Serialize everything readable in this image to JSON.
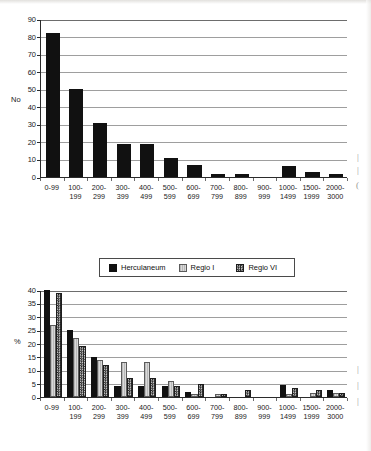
{
  "page": {
    "background": "#ffffff",
    "margin_marks": [
      "|",
      "|",
      "(",
      "|",
      "|",
      "|"
    ]
  },
  "colors": {
    "herculaneum": "#111111",
    "regio_i": "#d0d0d0",
    "regio_vi": "#3a3a3a",
    "axis": "#2b2b2b",
    "grid": "#9e9e9e"
  },
  "legend": {
    "position": "top-center",
    "entries": [
      {
        "label": "Herculaneum",
        "swatch": "solid-black"
      },
      {
        "label": "Regio I",
        "swatch": "light-gray"
      },
      {
        "label": "Regio VI",
        "swatch": "checkered"
      }
    ]
  },
  "chart_data": [
    {
      "id": "chart-top-counts",
      "type": "bar",
      "title": "",
      "xlabel": "",
      "ylabel": "No",
      "ylim": [
        0,
        90
      ],
      "yticks": [
        0,
        10,
        20,
        30,
        40,
        50,
        60,
        70,
        80,
        90
      ],
      "grid": true,
      "legend": false,
      "categories": [
        "0-99",
        "100-\n199",
        "200-\n299",
        "300-\n399",
        "400-\n499",
        "500-\n599",
        "600-\n699",
        "700-\n799",
        "800-\n899",
        "900-\n999",
        "1000-\n1499",
        "1500-\n1999",
        "2000-\n3000"
      ],
      "series": [
        {
          "name": "Herculaneum",
          "fill": "solid-black",
          "values": [
            82,
            50,
            31,
            19,
            19,
            11,
            7,
            2,
            2,
            0,
            6,
            3,
            2
          ]
        }
      ]
    },
    {
      "id": "chart-bottom-percent",
      "type": "bar",
      "title": "",
      "xlabel": "",
      "ylabel": "%",
      "ylim": [
        0,
        40
      ],
      "yticks": [
        0,
        5,
        10,
        15,
        20,
        25,
        30,
        35,
        40
      ],
      "grid": true,
      "legend": true,
      "categories": [
        "0-99",
        "100-\n199",
        "200-\n299",
        "300-\n399",
        "400-\n499",
        "500-\n599",
        "600-\n699",
        "700-\n799",
        "800-\n899",
        "900-\n999",
        "1000-\n1499",
        "1500-\n1999",
        "2000-\n3000"
      ],
      "series": [
        {
          "name": "Herculaneum",
          "fill": "solid-black",
          "values": [
            40,
            25,
            15,
            4,
            4,
            4,
            2,
            0,
            0,
            0,
            4.5,
            0,
            2.5
          ]
        },
        {
          "name": "Regio I",
          "fill": "light-gray",
          "values": [
            27,
            22,
            14,
            13,
            13,
            6,
            1,
            1,
            0,
            0,
            1,
            1.5,
            1.5
          ]
        },
        {
          "name": "Regio VI",
          "fill": "checkered",
          "values": [
            39,
            19,
            12,
            7,
            7,
            4,
            5,
            1,
            2.5,
            0,
            3.5,
            2.5,
            1.5
          ]
        }
      ]
    }
  ]
}
